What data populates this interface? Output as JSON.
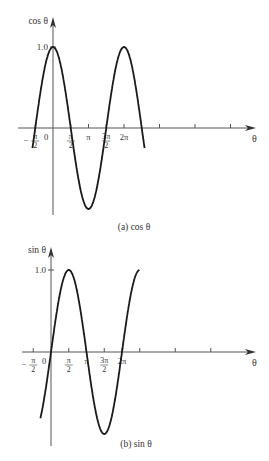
{
  "chart_data": [
    {
      "type": "line",
      "title": "(a) cos θ",
      "ylabel": "cos θ",
      "xlabel": "θ",
      "function": "cos",
      "ytick_label": "1.0",
      "xtick_labels": [
        {
          "value": -0.5,
          "label_num": "π",
          "label_den": "2",
          "label_prefix": "−"
        },
        {
          "value": 0,
          "label": "0"
        },
        {
          "value": 0.5,
          "label_num": "π",
          "label_den": "2"
        },
        {
          "value": 1,
          "label": "π"
        },
        {
          "value": 1.5,
          "label_num": "3π",
          "label_den": "2"
        },
        {
          "value": 2,
          "label": "2π"
        }
      ],
      "extra_ticks_at_pi": [
        3,
        4,
        5
      ],
      "x_range_pi": [
        -1.0,
        5.2
      ],
      "ylim": [
        -1,
        1
      ],
      "grid": false
    },
    {
      "type": "line",
      "title": "(b) sin θ",
      "ylabel": "sin θ",
      "xlabel": "θ",
      "function": "sin",
      "ytick_label": "1.0",
      "xtick_labels": [
        {
          "value": -0.5,
          "label_num": "π",
          "label_den": "2",
          "label_prefix": "−"
        },
        {
          "value": 0,
          "label": "0"
        },
        {
          "value": 0.5,
          "label_num": "π",
          "label_den": "2"
        },
        {
          "value": 1,
          "label": "π"
        },
        {
          "value": 1.5,
          "label_num": "3π",
          "label_den": "2"
        },
        {
          "value": 2,
          "label": "2π"
        }
      ],
      "extra_ticks_at_pi": [
        2.5,
        3.5,
        4.5
      ],
      "x_range_pi": [
        -0.6,
        5.0
      ],
      "ylim": [
        -1,
        1
      ],
      "grid": false
    }
  ]
}
